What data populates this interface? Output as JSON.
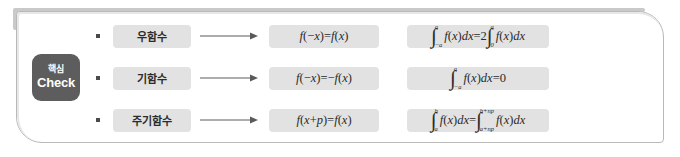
{
  "panel": {
    "badge": {
      "korean_label": "핵심",
      "english_label": "Check",
      "background_color": "#5d5d5d",
      "text_color": "#ffffff"
    },
    "border_color": "#b9b9b9",
    "box_color": "#e2e2e2"
  },
  "rows": [
    {
      "bullet": "•",
      "term": "우함수",
      "arrow": "right-arrow",
      "property": {
        "plain": "f(-x)=f(x)",
        "lhs_fn": "f",
        "lhs_arg": "(-x)",
        "equals": "=",
        "rhs_fn": "f",
        "rhs_arg": "(x)"
      },
      "integral": {
        "plain": "∫_{-a}^{a} f(x)dx = 2∫_{0}^{a} f(x)dx",
        "left": {
          "lower": "-a",
          "upper": "a",
          "integrand": "f(x)dx"
        },
        "equals": "=",
        "coefficient": "2",
        "right": {
          "lower": "0",
          "upper": "a",
          "integrand": "f(x)dx"
        }
      }
    },
    {
      "bullet": "•",
      "term": "기함수",
      "arrow": "right-arrow",
      "property": {
        "plain": "f(-x)=-f(x)",
        "lhs_fn": "f",
        "lhs_arg": "(-x)",
        "equals": "=",
        "sign": "-",
        "rhs_fn": "f",
        "rhs_arg": "(x)"
      },
      "integral": {
        "plain": "∫_{-a}^{a} f(x)dx = 0",
        "left": {
          "lower": "-a",
          "upper": "a",
          "integrand": "f(x)dx"
        },
        "equals": "=",
        "result": "0"
      }
    },
    {
      "bullet": "•",
      "term": "주기함수",
      "arrow": "right-arrow",
      "property": {
        "plain": "f(x+p)=f(x)",
        "lhs_fn": "f",
        "lhs_arg": "(x+p)",
        "equals": "=",
        "rhs_fn": "f",
        "rhs_arg": "(x)"
      },
      "integral": {
        "plain": "∫_{a}^{b} f(x)dx = ∫_{a+np}^{b+np} f(x)dx",
        "left": {
          "lower": "a",
          "upper": "b",
          "integrand": "f(x)dx"
        },
        "equals": "=",
        "right": {
          "lower": "a+np",
          "upper": "b+np",
          "integrand": "f(x)dx"
        }
      }
    }
  ]
}
